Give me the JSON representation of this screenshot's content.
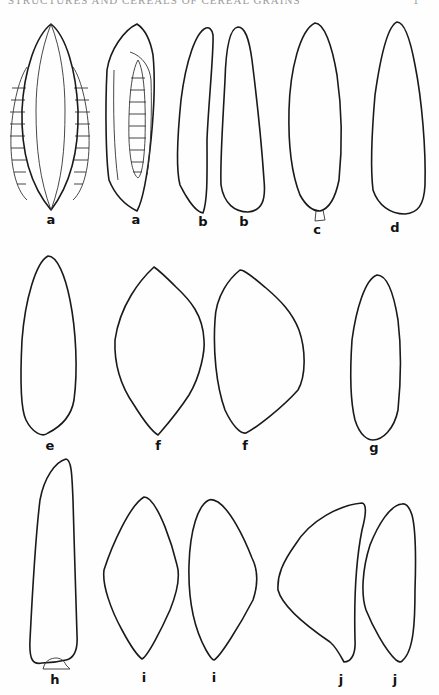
{
  "header": {
    "running_head": "STRUCTURES AND CEREALS OF CEREAL GRAINS",
    "page_number": "1"
  },
  "figure": {
    "type": "line-drawing-plate",
    "rows": [
      {
        "row": 1,
        "items": [
          {
            "label": "a",
            "view": "face view with embryo segments on both sides"
          },
          {
            "label": "a",
            "view": "side view with central segmented embryo"
          },
          {
            "label": "b",
            "view": "slender outline"
          },
          {
            "label": "b",
            "view": "slender outline"
          },
          {
            "label": "c",
            "view": "elongated outline with small basal attachment"
          },
          {
            "label": "d",
            "view": "elongated outline"
          }
        ]
      },
      {
        "row": 2,
        "items": [
          {
            "label": "e",
            "view": "elongated outline"
          },
          {
            "label": "f",
            "view": "lens-shaped outline"
          },
          {
            "label": "f",
            "view": "asymmetrical lens outline"
          },
          {
            "label": "g",
            "view": "narrow oval outline"
          }
        ]
      },
      {
        "row": 3,
        "items": [
          {
            "label": "h",
            "view": "long outline with basal cap"
          },
          {
            "label": "i",
            "view": "lens-shaped outline"
          },
          {
            "label": "i",
            "view": "asymmetrical outline"
          },
          {
            "label": "j",
            "view": "triangular outline"
          },
          {
            "label": "j",
            "view": "narrow asymmetrical outline"
          }
        ]
      }
    ],
    "labels": {
      "a1": "a",
      "a2": "a",
      "b1": "b",
      "b2": "b",
      "c": "c",
      "d": "d",
      "e": "e",
      "f1": "f",
      "f2": "f",
      "g": "g",
      "h": "h",
      "i1": "i",
      "i2": "i",
      "j1": "j",
      "j2": "j"
    },
    "colors": {
      "ink": "#1a1a1a",
      "paper": "#fefefe"
    }
  }
}
